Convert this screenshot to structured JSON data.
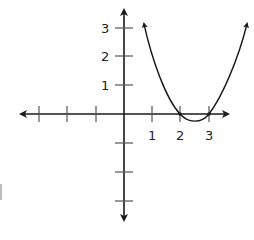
{
  "diagram": {
    "type": "coordinate-plane-graph",
    "function": "parabola with x-intercepts at 2 and 3",
    "colors": {
      "axis": "#1a1a1a",
      "curve": "#1a1a1a",
      "labels": "#222222"
    },
    "x_axis": {
      "tick_labels": [
        "1",
        "2",
        "3"
      ],
      "tick_count_negative": 3,
      "tick_count_positive": 3
    },
    "y_axis": {
      "tick_labels": [
        "1",
        "2",
        "3"
      ],
      "tick_count_positive": 3,
      "tick_count_negative": 3
    },
    "curve": {
      "x_intercepts": [
        2,
        3
      ],
      "vertex": [
        2.5,
        -0.25
      ],
      "arrows_both_ends": true
    }
  }
}
